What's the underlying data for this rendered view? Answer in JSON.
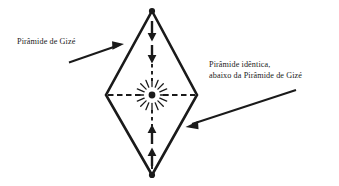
{
  "figure": {
    "type": "geometric-diagram",
    "background_color": "#ffffff",
    "stroke_color": "#1a1a1a"
  },
  "labels": {
    "left": {
      "lines": [
        "Pirâmide de Gizé"
      ],
      "pointer": "arrow-up-right"
    },
    "right": {
      "lines": [
        "Pirâmide idêntica,",
        "abaixo da Pirâmide de Gizé"
      ],
      "pointer": "arrow-down-left"
    }
  },
  "shape": {
    "vertices": {
      "top": [
        152,
        11
      ],
      "right": [
        197,
        95
      ],
      "bottom": [
        152,
        175
      ],
      "left": [
        106,
        95
      ]
    },
    "vertex_dots": [
      "top",
      "right",
      "bottom",
      "left"
    ],
    "axes": {
      "vertical_dashed": true,
      "horizontal_dashed": true
    },
    "arrows": {
      "downward_count": 2,
      "upward_count": 2,
      "direction": "toward-center"
    },
    "center": {
      "point": [
        152,
        95
      ],
      "starburst_rays": 16
    }
  }
}
